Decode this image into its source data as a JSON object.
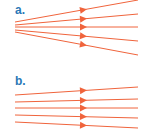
{
  "colors": {
    "label": "#2a78b6",
    "ray": "#f0643c"
  },
  "panels": [
    {
      "label": "a.",
      "description": "diverging rays",
      "rays": [
        {
          "x1": 15,
          "y1": 22,
          "x2": 138,
          "y2": 0
        },
        {
          "x1": 15,
          "y1": 25,
          "x2": 138,
          "y2": 14
        },
        {
          "x1": 15,
          "y1": 27,
          "x2": 138,
          "y2": 27
        },
        {
          "x1": 15,
          "y1": 30,
          "x2": 138,
          "y2": 41
        },
        {
          "x1": 15,
          "y1": 32,
          "x2": 138,
          "y2": 55
        }
      ]
    },
    {
      "label": "b.",
      "description": "nearly parallel rays",
      "rays": [
        {
          "x1": 15,
          "y1": 95,
          "x2": 138,
          "y2": 87
        },
        {
          "x1": 15,
          "y1": 102,
          "x2": 138,
          "y2": 99
        },
        {
          "x1": 15,
          "y1": 108,
          "x2": 138,
          "y2": 108
        },
        {
          "x1": 15,
          "y1": 115,
          "x2": 138,
          "y2": 118
        },
        {
          "x1": 15,
          "y1": 122,
          "x2": 138,
          "y2": 128
        }
      ]
    }
  ],
  "arrow_position_x": 83
}
